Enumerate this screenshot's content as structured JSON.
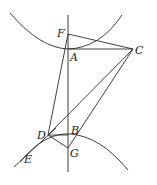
{
  "diagram": {
    "type": "geometric-construction",
    "colors": {
      "stroke": "#2b2b2b",
      "label": "#222222",
      "background": "#ffffff"
    },
    "points": {
      "F": {
        "label": "F",
        "x": 68,
        "y": 34
      },
      "A": {
        "label": "A",
        "x": 68,
        "y": 49
      },
      "C": {
        "label": "C",
        "x": 133,
        "y": 49
      },
      "D": {
        "label": "D",
        "x": 48,
        "y": 135
      },
      "B": {
        "label": "B",
        "x": 68,
        "y": 135
      },
      "G": {
        "label": "G",
        "x": 68,
        "y": 148
      },
      "E": {
        "label": "E",
        "x": 25,
        "y": 158
      }
    },
    "segments": [
      [
        "F",
        "C"
      ],
      [
        "A",
        "C"
      ],
      [
        "F",
        "D"
      ],
      [
        "D",
        "C"
      ],
      [
        "C",
        "G"
      ],
      [
        "D",
        "B"
      ],
      [
        "D",
        "G"
      ]
    ],
    "axis_line": {
      "x": 68,
      "y1": 15,
      "y2": 172
    },
    "curves": [
      "upper-parabola",
      "lower-parabola"
    ],
    "tangent": {
      "through": "D",
      "label": "E"
    }
  }
}
